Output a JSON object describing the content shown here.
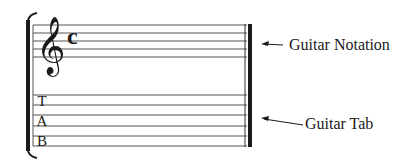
{
  "diagram": {
    "notation_staff": {
      "clef": "treble-clef",
      "clef_glyph": "𝄞",
      "time_signature": "c",
      "line_count": 5
    },
    "tab_staff": {
      "letters": [
        "T",
        "A",
        "B"
      ],
      "line_count": 6
    },
    "labels": {
      "notation": "Guitar Notation",
      "tab": "Guitar Tab"
    },
    "colors": {
      "ink": "#1a1a1a",
      "staff_line": "#555555",
      "background": "#ffffff"
    }
  }
}
